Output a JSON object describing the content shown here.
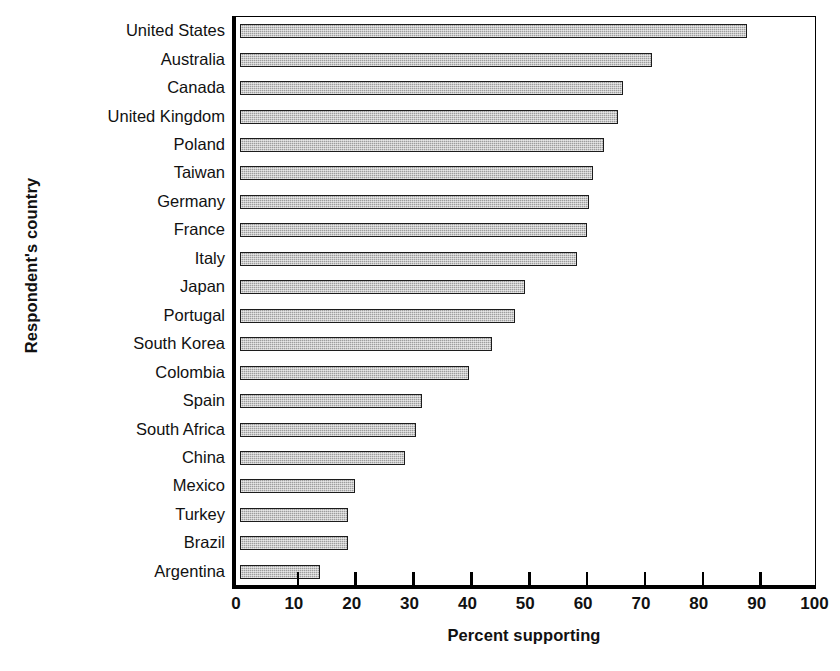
{
  "chart_data": {
    "type": "bar",
    "orientation": "horizontal",
    "title": "",
    "xlabel": "Percent supporting",
    "ylabel": "Respondent's country",
    "xlim": [
      0,
      100
    ],
    "xticks": [
      0,
      10,
      20,
      30,
      40,
      50,
      60,
      70,
      80,
      90,
      100
    ],
    "grid": false,
    "legend": null,
    "categories": [
      "United States",
      "Australia",
      "Canada",
      "United Kingdom",
      "Poland",
      "Taiwan",
      "Germany",
      "France",
      "Italy",
      "Japan",
      "Portugal",
      "South Korea",
      "Colombia",
      "Spain",
      "South Africa",
      "China",
      "Mexico",
      "Turkey",
      "Brazil",
      "Argentina"
    ],
    "values": [
      87.6,
      71.2,
      66.2,
      65.3,
      63.0,
      61.0,
      60.4,
      60.0,
      58.3,
      49.3,
      47.5,
      43.5,
      39.5,
      31.5,
      30.5,
      28.5,
      19.8,
      18.7,
      18.7,
      13.8
    ],
    "bar_color": "#9d9d9d",
    "bar_edge_color": "#1c1c1c",
    "axis_color": "#000000"
  }
}
